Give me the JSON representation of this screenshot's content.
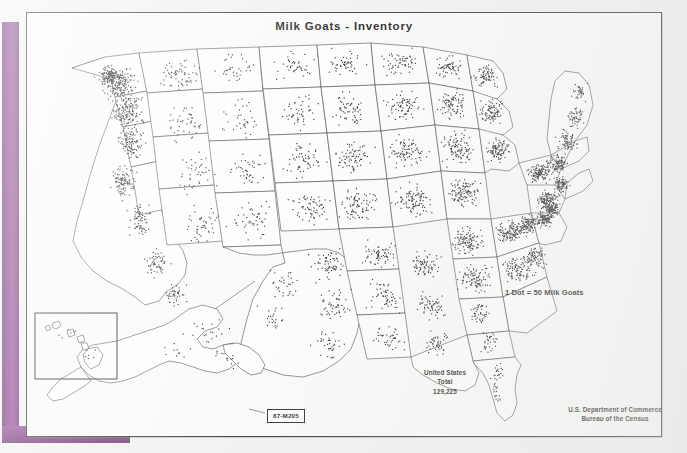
{
  "document": {
    "kind": "scanned-thematic-map",
    "title": "Milk Goats - Inventory",
    "map_code": "87-M205"
  },
  "legend": {
    "dot_value_note": "1 Dot = 50 Milk Goats"
  },
  "totals": {
    "area_label": "United States",
    "total_label": "Total",
    "total_value": "129,225"
  },
  "source": {
    "department": "U.S. Department of Commerce",
    "bureau": "Bureau of the Census"
  },
  "colors": {
    "binder_purple": "#7d3281",
    "frame_border": "#2a2a2a",
    "dot_color": "#141414",
    "paper": "#f2f2f0",
    "map_background": "#fbfbfa"
  },
  "chart_data": {
    "type": "dot-density-map",
    "title": "Milk Goats - Inventory",
    "variable": "Milk goats inventory",
    "dot_value": 50,
    "dot_unit": "milk goats",
    "national_total": 129225,
    "regions_shown": [
      "Conterminous United States",
      "Alaska",
      "Hawaii"
    ],
    "annotations": [
      "1 Dot = 50 Milk Goats",
      "United States Total 129,225",
      "U.S. Department of Commerce Bureau of the Census",
      "87-M205"
    ]
  }
}
